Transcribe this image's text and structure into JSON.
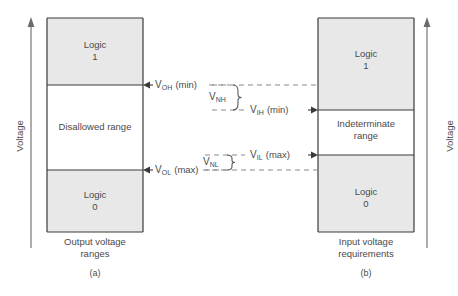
{
  "figure": {
    "type": "logic-voltage-level-diagram",
    "background_color": "#ffffff",
    "band_fill_color": "#e8e8e8",
    "line_color": "#3a3a3a",
    "text_color": "#4a4a4a"
  },
  "axes": {
    "left_label": "Voltage",
    "right_label": "Voltage"
  },
  "left_column": {
    "caption_line1": "Output voltage",
    "caption_line2": "ranges",
    "sublabel": "(a)",
    "bands": [
      {
        "name": "logic-high",
        "line1": "Logic",
        "line2": "1",
        "filled": true
      },
      {
        "name": "disallowed",
        "line1": "Disallowed range",
        "line2": "",
        "filled": false
      },
      {
        "name": "logic-low",
        "line1": "Logic",
        "line2": "0",
        "filled": true
      }
    ]
  },
  "right_column": {
    "caption_line1": "Input voltage",
    "caption_line2": "requirements",
    "sublabel": "(b)",
    "bands": [
      {
        "name": "logic-high",
        "line1": "Logic",
        "line2": "1",
        "filled": true
      },
      {
        "name": "indeterminate",
        "line1": "Indeterminate",
        "line2": "range",
        "filled": false
      },
      {
        "name": "logic-low",
        "line1": "Logic",
        "line2": "0",
        "filled": true
      }
    ]
  },
  "thresholds": {
    "voh": {
      "symbol": "V",
      "subscript": "OH",
      "qualifier": "(min)"
    },
    "vol": {
      "symbol": "V",
      "subscript": "OL",
      "qualifier": "(max)"
    },
    "vih": {
      "symbol": "V",
      "subscript": "IH",
      "qualifier": "(min)"
    },
    "vil": {
      "symbol": "V",
      "subscript": "IL",
      "qualifier": "(max)"
    }
  },
  "margins": {
    "vnh": {
      "symbol": "V",
      "subscript": "NH"
    },
    "vnl": {
      "symbol": "V",
      "subscript": "NL"
    }
  }
}
